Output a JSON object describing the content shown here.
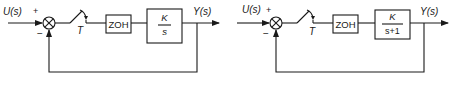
{
  "diagrams": [
    {
      "input_label": "U(s)",
      "plus_sign": "+",
      "minus_sign": "−",
      "sampler_label": "T",
      "zoh_label": "ZOH",
      "plant_num": "K",
      "plant_den": "s",
      "output_label": "Y(s)"
    },
    {
      "input_label": "U(s)",
      "plus_sign": "+",
      "minus_sign": "−",
      "sampler_label": "T",
      "zoh_label": "ZOH",
      "plant_num": "K",
      "plant_den": "s+1",
      "output_label": "Y(s)"
    }
  ],
  "colors": {
    "line": "#1a1a1a",
    "background": "#ffffff"
  }
}
